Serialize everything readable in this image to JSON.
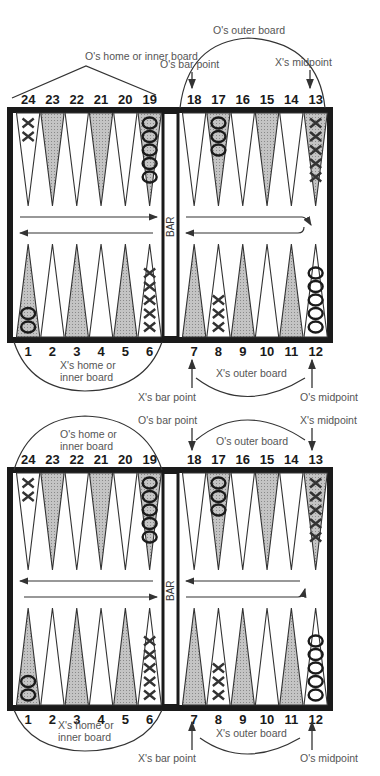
{
  "diagrams": [
    {
      "id": "board-top",
      "top_labels": {
        "o_home": "O's home or inner board",
        "o_outer": "O's outer board",
        "o_bar_point": "O's bar point",
        "x_midpoint": "X's midpoint"
      },
      "bottom_labels": {
        "x_home_1": "X's home or",
        "x_home_2": "inner board",
        "x_outer": "X's outer board",
        "x_bar_point": "X's bar point",
        "o_midpoint": "O's midpoint"
      },
      "bar_label": "BAR"
    },
    {
      "id": "board-bottom",
      "top_labels": {
        "o_home_1": "O's home or",
        "o_home_2": "inner board",
        "o_outer": "O's outer board",
        "o_bar_point": "O's bar point",
        "x_midpoint": "X's midpoint"
      },
      "bottom_labels": {
        "x_home_1": "X's home or",
        "x_home_2": "inner board",
        "x_outer": "X's outer board",
        "x_bar_point": "X's bar point",
        "o_midpoint": "O's midpoint"
      },
      "bar_label": "BAR"
    }
  ],
  "points_top": [
    "24",
    "23",
    "22",
    "21",
    "20",
    "19",
    "18",
    "17",
    "16",
    "15",
    "14",
    "13"
  ],
  "points_bottom": [
    "1",
    "2",
    "3",
    "4",
    "5",
    "6",
    "7",
    "8",
    "9",
    "10",
    "11",
    "12"
  ],
  "checkers": {
    "24": {
      "player": "X",
      "count": 2
    },
    "19": {
      "player": "O",
      "count": 5
    },
    "17": {
      "player": "O",
      "count": 3
    },
    "13": {
      "player": "X",
      "count": 5
    },
    "1": {
      "player": "O",
      "count": 2
    },
    "6": {
      "player": "X",
      "count": 5
    },
    "8": {
      "player": "X",
      "count": 3
    },
    "12": {
      "player": "O",
      "count": 5
    }
  },
  "colors": {
    "frame": "#1a1a1a",
    "shaded_point": "#b8b8b8",
    "line": "#333333",
    "label": "#555555"
  }
}
